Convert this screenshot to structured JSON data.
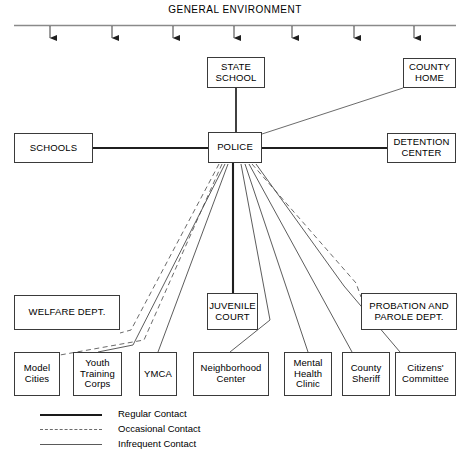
{
  "diagram": {
    "title": "GENERAL ENVIRONMENT",
    "environment_arrow_count": 7,
    "central_node": "POLICE",
    "nodes": {
      "state_school": "STATE\nSCHOOL",
      "county_home": "COUNTY\nHOME",
      "schools": "SCHOOLS",
      "police": "POLICE",
      "detention_center": "DETENTION\nCENTER",
      "welfare_dept": "WELFARE DEPT.",
      "juvenile_court": "JUVENILE\nCOURT",
      "probation_parole": "PROBATION AND\nPAROLE DEPT.",
      "model_cities": "Model\nCities",
      "youth_training_corps": "Youth\nTraining\nCorps",
      "ymca": "YMCA",
      "neighborhood_center": "Neighborhood\nCenter",
      "mental_health_clinic": "Mental\nHealth\nClinic",
      "county_sheriff": "County\nSheriff",
      "citizens_committee": "Citizens'\nCommittee"
    },
    "legend": [
      {
        "style": "regular",
        "label": "Regular Contact"
      },
      {
        "style": "occasional",
        "label": "Occasional Contact"
      },
      {
        "style": "infrequent",
        "label": "Infrequent Contact"
      }
    ],
    "colors": {
      "line": "#3a3a3a",
      "line_thick": "#1a1a1a",
      "line_dashed": "#6b6b6b",
      "background": "#ffffff",
      "text": "#000000"
    },
    "edges": [
      {
        "from": "state_school",
        "to": "police",
        "style": "regular"
      },
      {
        "from": "county_home",
        "to": "police",
        "style": "infrequent"
      },
      {
        "from": "schools",
        "to": "police",
        "style": "regular"
      },
      {
        "from": "detention_center",
        "to": "police",
        "style": "regular"
      },
      {
        "from": "police",
        "to": "juvenile_court",
        "style": "regular"
      },
      {
        "from": "police",
        "to": "welfare_dept",
        "style": "occasional"
      },
      {
        "from": "police",
        "to": "model_cities",
        "style": "occasional"
      },
      {
        "from": "police",
        "to": "youth_training_corps",
        "style": "infrequent"
      },
      {
        "from": "police",
        "to": "ymca",
        "style": "infrequent"
      },
      {
        "from": "police",
        "to": "neighborhood_center",
        "style": "infrequent"
      },
      {
        "from": "police",
        "to": "mental_health_clinic",
        "style": "infrequent"
      },
      {
        "from": "police",
        "to": "county_sheriff",
        "style": "infrequent"
      },
      {
        "from": "police",
        "to": "citizens_committee",
        "style": "infrequent"
      },
      {
        "from": "police",
        "to": "probation_parole",
        "style": "occasional"
      }
    ]
  }
}
